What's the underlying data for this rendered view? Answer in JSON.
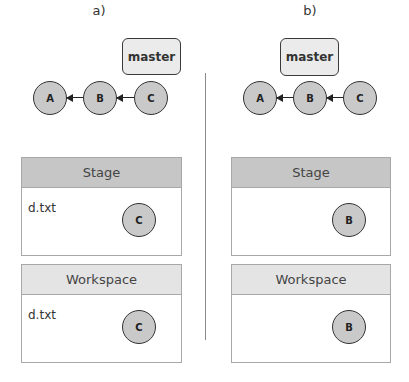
{
  "panels": [
    {
      "label": "a)",
      "branch": "master",
      "commits": [
        "A",
        "B",
        "C"
      ],
      "branch_points_to": "C",
      "stage": {
        "title": "Stage",
        "file": "d.txt",
        "commit": "C"
      },
      "workspace": {
        "title": "Workspace",
        "file": "d.txt",
        "commit": "C"
      }
    },
    {
      "label": "b)",
      "branch": "master",
      "commits": [
        "A",
        "B",
        "C"
      ],
      "branch_points_to": "B",
      "stage": {
        "title": "Stage",
        "file": "",
        "commit": "B"
      },
      "workspace": {
        "title": "Workspace",
        "file": "",
        "commit": "B"
      }
    }
  ],
  "colors": {
    "node_fill": "#c9c9c9",
    "stage_header": "#c6c6c6",
    "workspace_header": "#e4e4e4",
    "branch_fill": "#ebebeb"
  }
}
